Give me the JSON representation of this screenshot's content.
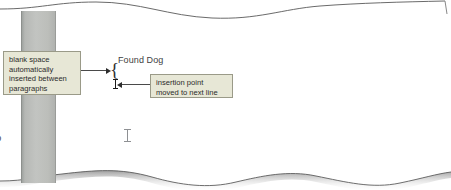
{
  "figure": {
    "type": "annotated-document-illustration"
  },
  "page": {
    "background_color": "#ffffff",
    "edge_line_color": "#5a5a5a",
    "shadow_color": "#9a9a9a"
  },
  "margin_bar": {
    "label": "vertical-scroll-ruler-bar",
    "color": "#b6b8b5",
    "border_color": "#8d908d"
  },
  "document": {
    "heading_text": "Found Dog",
    "clipped_left_text": "o",
    "brace_glyph": "{",
    "caret_name": "insertion-point-caret",
    "pointer_name": "i-beam-pointer"
  },
  "callouts": [
    {
      "id": "blank-space",
      "lines": [
        "blank space",
        "automatically",
        "inserted between",
        "paragraphs"
      ],
      "background_color": "#e7e7d6",
      "border_color": "#9a9a88",
      "text_color": "#2b2b2b"
    },
    {
      "id": "insertion-point",
      "lines": [
        "insertion point",
        "moved to next line"
      ],
      "background_color": "#e7e7d6",
      "border_color": "#9a9a88",
      "text_color": "#2b2b2b"
    }
  ],
  "leaders": [
    {
      "id": "leader-blank-space",
      "direction": "right",
      "color": "#2d2d2d"
    },
    {
      "id": "leader-insertion-point",
      "direction": "left",
      "color": "#2d2d2d"
    }
  ]
}
